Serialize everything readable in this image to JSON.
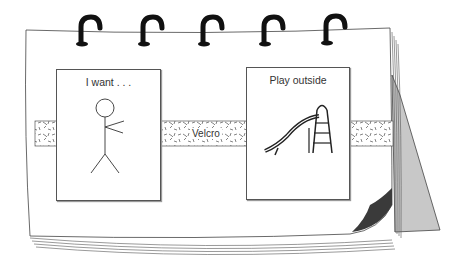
{
  "figure": {
    "rings_count": 5,
    "colors": {
      "paper": "#ffffff",
      "outline": "#444444",
      "ring": "#111111",
      "back_stand": "#c8c8c8",
      "page_curl": "#3a3a3a"
    }
  },
  "cards": [
    {
      "id": "i-want",
      "title": "I want . . .",
      "icon": "stick-figure-pointing-icon"
    },
    {
      "id": "play-outside",
      "title": "Play outside",
      "icon": "playground-slide-icon"
    }
  ],
  "velcro": {
    "label": "Velcro"
  }
}
